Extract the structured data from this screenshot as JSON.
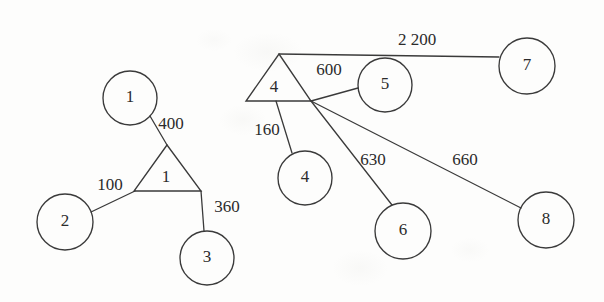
{
  "diagram": {
    "background_color": "#fdfdfc",
    "stroke_color": "#3a3a3a",
    "text_color": "#2b2b2b",
    "nodes": [
      {
        "id": "circle-1",
        "label": "1",
        "shape": "circle",
        "cx": 130,
        "cy": 98,
        "r": 27
      },
      {
        "id": "circle-2",
        "label": "2",
        "shape": "circle",
        "cx": 65,
        "cy": 222,
        "r": 28
      },
      {
        "id": "circle-3",
        "label": "3",
        "shape": "circle",
        "cx": 207,
        "cy": 258,
        "r": 27
      },
      {
        "id": "triangle-1",
        "label": "1",
        "shape": "triangle",
        "apex_x": 167,
        "apex_y": 145,
        "base_left_x": 134,
        "base_right_x": 201,
        "base_y": 191,
        "label_x": 166,
        "label_y": 178
      },
      {
        "id": "triangle-4",
        "label": "4",
        "shape": "triangle",
        "apex_x": 279,
        "apex_y": 54,
        "base_left_x": 246,
        "base_right_x": 311,
        "base_y": 101,
        "label_x": 274,
        "label_y": 88
      },
      {
        "id": "circle-4",
        "label": "4",
        "shape": "circle",
        "cx": 305,
        "cy": 178,
        "r": 27
      },
      {
        "id": "circle-5",
        "label": "5",
        "shape": "circle",
        "cx": 385,
        "cy": 85,
        "r": 27
      },
      {
        "id": "circle-6",
        "label": "6",
        "shape": "circle",
        "cx": 403,
        "cy": 231,
        "r": 28
      },
      {
        "id": "circle-7",
        "label": "7",
        "shape": "circle",
        "cx": 527,
        "cy": 66,
        "r": 28
      },
      {
        "id": "circle-8",
        "label": "8",
        "shape": "circle",
        "cx": 546,
        "cy": 220,
        "r": 28
      }
    ],
    "edges": [
      {
        "id": "edge-1-t1",
        "from": "circle-1",
        "to": "triangle-1",
        "weight": "400",
        "x1": 150,
        "y1": 116,
        "x2": 167,
        "y2": 145,
        "label_x": 171,
        "label_y": 125
      },
      {
        "id": "edge-2-t1",
        "from": "circle-2",
        "to": "triangle-1",
        "weight": "100",
        "x1": 91,
        "y1": 212,
        "x2": 135,
        "y2": 191,
        "label_x": 110,
        "label_y": 186
      },
      {
        "id": "edge-t1-3",
        "from": "triangle-1",
        "to": "circle-3",
        "weight": "360",
        "x1": 201,
        "y1": 191,
        "x2": 204,
        "y2": 231,
        "label_x": 227,
        "label_y": 208
      },
      {
        "id": "edge-t4-7",
        "from": "triangle-4",
        "to": "circle-7",
        "weight": "2 200",
        "x1": 279,
        "y1": 54,
        "x2": 499,
        "y2": 57,
        "label_x": 417,
        "label_y": 41
      },
      {
        "id": "edge-t4-5",
        "from": "triangle-4",
        "to": "circle-5",
        "weight": "600",
        "x1": 311,
        "y1": 101,
        "x2": 358,
        "y2": 88,
        "label_x": 329,
        "label_y": 71
      },
      {
        "id": "edge-t4-4",
        "from": "triangle-4",
        "to": "circle-4",
        "weight": "160",
        "x1": 276,
        "y1": 101,
        "x2": 292,
        "y2": 153,
        "label_x": 267,
        "label_y": 131
      },
      {
        "id": "edge-t4-6",
        "from": "triangle-4",
        "to": "circle-6",
        "weight": "630",
        "x1": 311,
        "y1": 101,
        "x2": 392,
        "y2": 205,
        "label_x": 373,
        "label_y": 161
      },
      {
        "id": "edge-t4-8",
        "from": "triangle-4",
        "to": "circle-8",
        "weight": "660",
        "x1": 311,
        "y1": 101,
        "x2": 521,
        "y2": 208,
        "label_x": 465,
        "label_y": 161
      }
    ]
  }
}
